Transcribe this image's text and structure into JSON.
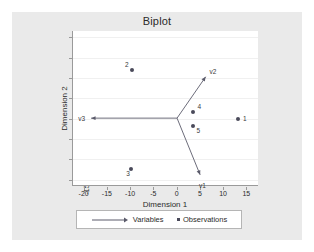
{
  "chart_data": {
    "type": "scatter",
    "title": "Biplot",
    "xlabel": "Dimension 1",
    "ylabel": "Dimension 2",
    "xlim": [
      -22.5,
      17.5
    ],
    "ylim": [
      -16.5,
      21.5
    ],
    "xticks": [
      -20,
      -15,
      -10,
      -5,
      0,
      5,
      10,
      15
    ],
    "xtick_labels": [
      "-20",
      "-15",
      "-10",
      "-5",
      "0",
      "5",
      "10",
      "15"
    ],
    "yticks": [
      -15,
      -10,
      -5,
      0,
      5,
      10,
      15,
      20
    ],
    "ytick_labels": [
      "-15",
      "-10",
      "-5",
      "0",
      "5",
      "10",
      "15",
      "20"
    ],
    "grid": true,
    "legend_position": "bottom",
    "series": [
      {
        "name": "Variables",
        "type": "vectors",
        "origin": [
          0,
          0
        ],
        "values": [
          {
            "label": "v1",
            "x": 5.0,
            "y": -14.0
          },
          {
            "label": "v2",
            "x": 6.2,
            "y": 10.2
          },
          {
            "label": "v3",
            "x": -18.6,
            "y": 0.0
          }
        ]
      },
      {
        "name": "Observations",
        "type": "points",
        "values": [
          {
            "label": "1",
            "x": 13.0,
            "y": 0.0
          },
          {
            "label": "2",
            "x": -9.8,
            "y": 12.0
          },
          {
            "label": "3",
            "x": -10.0,
            "y": -12.3
          },
          {
            "label": "4",
            "x": 3.4,
            "y": 1.7
          },
          {
            "label": "5",
            "x": 3.2,
            "y": -1.8
          }
        ]
      }
    ]
  },
  "legend": {
    "variables_label": "Variables",
    "observations_label": "Observations"
  },
  "colors": {
    "marker": "#4a4a5a",
    "vector": "#5a5a6a",
    "axis": "#9a9a9a",
    "grid": "#f0f0f0",
    "card_background": "#eaeaea",
    "plot_background": "#ffffff",
    "text": "#2b2b2b"
  }
}
